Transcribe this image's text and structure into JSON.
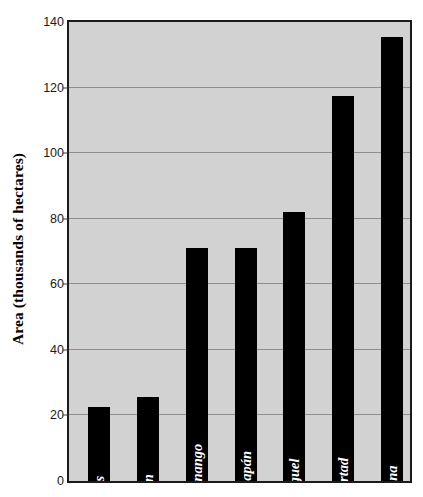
{
  "chart_data": {
    "type": "bar",
    "title": "",
    "subtitle": "",
    "xlabel": "",
    "ylabel": "Area (thousands of hectares)",
    "ylim": [
      0,
      140
    ],
    "yticks": [
      0,
      20,
      40,
      60,
      80,
      100,
      120,
      140
    ],
    "ytick_labels": [
      "0",
      "20",
      "40",
      "60",
      "80",
      "100",
      "120",
      "140"
    ],
    "grid": "horizontal",
    "legend": "none",
    "categories": [
      "Cabañas",
      "Morazán",
      "Chalatenango",
      "Ahuachapán",
      "San Miguel",
      "La Libertad",
      "Santa Ana"
    ],
    "values": [
      22.5,
      25.5,
      71,
      71,
      82,
      117.5,
      135.5
    ],
    "series": [
      {
        "name": "Area",
        "values": [
          22.5,
          25.5,
          71,
          71,
          82,
          117.5,
          135.5
        ]
      }
    ],
    "bar_color": "#000000",
    "plot_background_color": "#d2d2d2",
    "gridline_color": "#8e8e8e",
    "frame_color": "#1b1b1b",
    "bar_label_color": "#ffffff",
    "labels_inside_bars": true
  }
}
